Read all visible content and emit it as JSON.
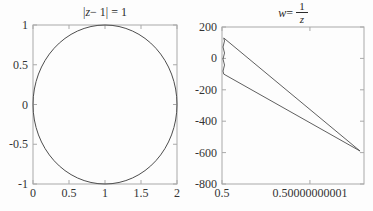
{
  "figure": {
    "background": "#fdfdfd",
    "frame_color": "#a9a9a9",
    "curve_color": "#4d4d4d",
    "label_color": "#333333"
  },
  "chart_data": [
    {
      "type": "line",
      "id": "circle-plot",
      "title_text": "|z − 1| = 1",
      "title": {
        "prefix": "|",
        "var": "z",
        "suffix": " − 1| = 1"
      },
      "xlabel": "",
      "ylabel": "",
      "xlim": [
        0,
        2
      ],
      "ylim": [
        -1,
        1
      ],
      "grid": false,
      "xticks": [
        {
          "v": 0,
          "label": "0"
        },
        {
          "v": 0.5,
          "label": "0.5"
        },
        {
          "v": 1,
          "label": "1"
        },
        {
          "v": 1.5,
          "label": "1.5"
        },
        {
          "v": 2,
          "label": "2"
        }
      ],
      "yticks": [
        {
          "v": 1,
          "label": "1"
        },
        {
          "v": 0.5,
          "label": "0.5"
        },
        {
          "v": 0,
          "label": "0"
        },
        {
          "v": -0.5,
          "label": "-0.5"
        },
        {
          "v": -1,
          "label": "-1"
        }
      ],
      "series": [
        {
          "name": "unit-circle-centered-at-1",
          "shape": "ellipse",
          "center": [
            1,
            0
          ],
          "rx": 1,
          "ry": 1
        }
      ]
    },
    {
      "type": "line",
      "id": "w-plot",
      "title_text": "w = 1/z",
      "title": {
        "var": "w",
        "eq": " = ",
        "num": "1",
        "den": "z"
      },
      "xlabel": "",
      "ylabel": "",
      "x_note": "x values are offsets from 0.5 in units of 1e-11",
      "xlim": [
        0,
        1.615
      ],
      "ylim": [
        -800,
        200
      ],
      "grid": false,
      "xticks": [
        {
          "v": 0,
          "label": "0.5"
        },
        {
          "v": 1,
          "label": "0.50000000001"
        }
      ],
      "yticks": [
        {
          "v": 200,
          "label": "200"
        },
        {
          "v": 0,
          "label": "0"
        },
        {
          "v": -200,
          "label": "-200"
        },
        {
          "v": -400,
          "label": "-400"
        },
        {
          "v": -600,
          "label": "-600"
        },
        {
          "v": -800,
          "label": "-800"
        }
      ],
      "series": [
        {
          "name": "upper-branch",
          "points": [
            [
              0.02,
              130
            ],
            [
              1.57,
              -590
            ]
          ]
        },
        {
          "name": "lower-branch",
          "points": [
            [
              0.02,
              -100
            ],
            [
              1.57,
              -590
            ]
          ]
        },
        {
          "name": "noise-squiggle",
          "wavy": true,
          "points": [
            [
              0.02,
              130
            ],
            [
              0.02,
              -100
            ]
          ]
        }
      ]
    }
  ]
}
